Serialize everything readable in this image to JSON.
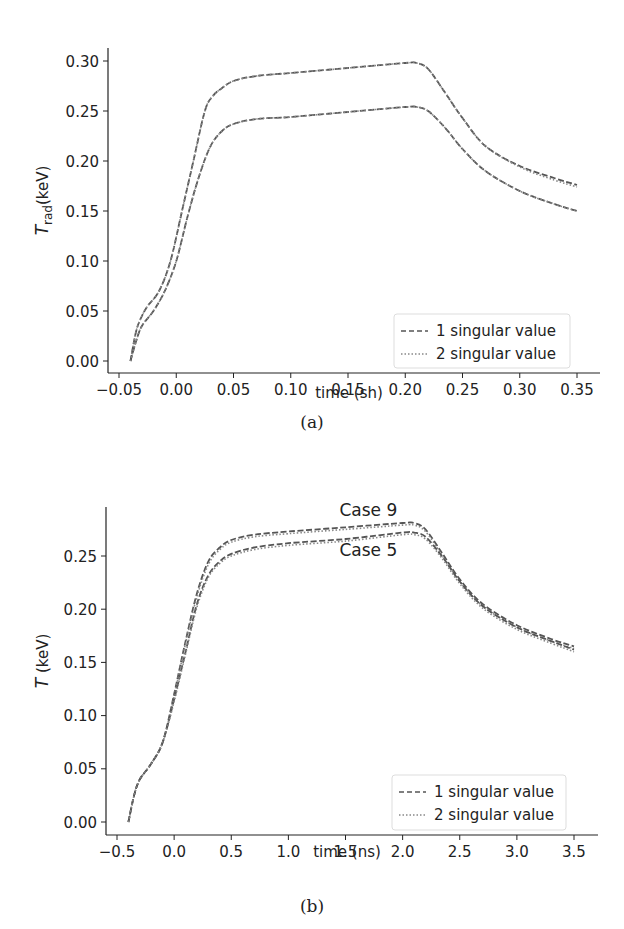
{
  "chart_data": [
    {
      "id": "a",
      "type": "line",
      "caption": "(a)",
      "title": "",
      "xlabel": "time (sh)",
      "ylabel_main": "T",
      "ylabel_sub": "rad",
      "ylabel_unit": "(keV)",
      "xlim": [
        -0.05,
        0.35
      ],
      "ylim": [
        0.0,
        0.3
      ],
      "xticks": [
        "−0.05",
        "0.00",
        "0.05",
        "0.10",
        "0.15",
        "0.20",
        "0.25",
        "0.30",
        "0.35"
      ],
      "xtick_values": [
        -0.05,
        0.0,
        0.05,
        0.1,
        0.15,
        0.2,
        0.25,
        0.3,
        0.35
      ],
      "yticks": [
        "0.00",
        "0.05",
        "0.10",
        "0.15",
        "0.20",
        "0.25",
        "0.30"
      ],
      "ytick_values": [
        0.0,
        0.05,
        0.1,
        0.15,
        0.2,
        0.25,
        0.3
      ],
      "grid": false,
      "legend_position": "lower right",
      "legend": [
        {
          "label": "1 singular value",
          "style": "dashed"
        },
        {
          "label": "2 singular value",
          "style": "dotted"
        }
      ],
      "series": [
        {
          "name": "upper case - 1 singular value",
          "style": "dashed",
          "x": [
            -0.04,
            -0.035,
            -0.03,
            -0.025,
            -0.015,
            -0.005,
            0.005,
            0.015,
            0.025,
            0.032,
            0.04,
            0.05,
            0.07,
            0.1,
            0.15,
            0.2,
            0.21,
            0.22,
            0.235,
            0.25,
            0.27,
            0.3,
            0.33,
            0.35
          ],
          "y": [
            0.0,
            0.03,
            0.045,
            0.055,
            0.07,
            0.1,
            0.15,
            0.2,
            0.25,
            0.265,
            0.273,
            0.28,
            0.285,
            0.288,
            0.293,
            0.298,
            0.298,
            0.292,
            0.268,
            0.243,
            0.215,
            0.195,
            0.183,
            0.176
          ]
        },
        {
          "name": "upper case - 2 singular value",
          "style": "dotted",
          "x": [
            -0.04,
            -0.035,
            -0.03,
            -0.025,
            -0.015,
            -0.005,
            0.005,
            0.015,
            0.025,
            0.032,
            0.04,
            0.05,
            0.07,
            0.1,
            0.15,
            0.2,
            0.21,
            0.22,
            0.235,
            0.25,
            0.27,
            0.3,
            0.33,
            0.35
          ],
          "y": [
            0.0,
            0.03,
            0.045,
            0.055,
            0.07,
            0.1,
            0.15,
            0.2,
            0.25,
            0.265,
            0.273,
            0.28,
            0.285,
            0.288,
            0.293,
            0.298,
            0.298,
            0.292,
            0.268,
            0.243,
            0.215,
            0.194,
            0.181,
            0.174
          ]
        },
        {
          "name": "lower case - 1 singular value",
          "style": "dashed",
          "x": [
            -0.04,
            -0.035,
            -0.03,
            -0.02,
            -0.01,
            0.0,
            0.01,
            0.02,
            0.03,
            0.04,
            0.05,
            0.07,
            0.1,
            0.15,
            0.2,
            0.21,
            0.22,
            0.235,
            0.25,
            0.27,
            0.3,
            0.33,
            0.35
          ],
          "y": [
            0.0,
            0.02,
            0.035,
            0.05,
            0.07,
            0.1,
            0.145,
            0.185,
            0.215,
            0.23,
            0.237,
            0.242,
            0.244,
            0.249,
            0.254,
            0.254,
            0.25,
            0.233,
            0.212,
            0.19,
            0.17,
            0.157,
            0.15
          ]
        },
        {
          "name": "lower case - 2 singular value",
          "style": "dotted",
          "x": [
            -0.04,
            -0.035,
            -0.03,
            -0.02,
            -0.01,
            0.0,
            0.01,
            0.02,
            0.03,
            0.04,
            0.05,
            0.07,
            0.1,
            0.15,
            0.2,
            0.21,
            0.22,
            0.235,
            0.25,
            0.27,
            0.3,
            0.33,
            0.35
          ],
          "y": [
            0.0,
            0.02,
            0.035,
            0.05,
            0.07,
            0.1,
            0.145,
            0.185,
            0.215,
            0.23,
            0.237,
            0.242,
            0.244,
            0.249,
            0.254,
            0.254,
            0.25,
            0.233,
            0.212,
            0.19,
            0.17,
            0.157,
            0.15
          ]
        }
      ],
      "annotations": []
    },
    {
      "id": "b",
      "type": "line",
      "caption": "(b)",
      "title": "",
      "xlabel": "time (ns)",
      "ylabel_main": "T",
      "ylabel_sub": "",
      "ylabel_unit": " (keV)",
      "xlim": [
        -0.5,
        3.5
      ],
      "ylim": [
        0.0,
        0.25
      ],
      "xticks": [
        "−0.5",
        "0.0",
        "0.5",
        "1.0",
        "1.5",
        "2.0",
        "2.5",
        "3.0",
        "3.5"
      ],
      "xtick_values": [
        -0.5,
        0.0,
        0.5,
        1.0,
        1.5,
        2.0,
        2.5,
        3.0,
        3.5
      ],
      "yticks": [
        "0.00",
        "0.05",
        "0.10",
        "0.15",
        "0.20",
        "0.25"
      ],
      "ytick_values": [
        0.0,
        0.05,
        0.1,
        0.15,
        0.2,
        0.25
      ],
      "grid": false,
      "legend_position": "lower right",
      "legend": [
        {
          "label": "1 singular value",
          "style": "dashed"
        },
        {
          "label": "2 singular value",
          "style": "dotted"
        }
      ],
      "series": [
        {
          "name": "Case 9 - 1 singular value",
          "style": "dashed",
          "x": [
            -0.4,
            -0.35,
            -0.3,
            -0.2,
            -0.1,
            0.0,
            0.1,
            0.2,
            0.3,
            0.4,
            0.5,
            0.7,
            1.0,
            1.5,
            2.0,
            2.1,
            2.2,
            2.35,
            2.5,
            2.7,
            3.0,
            3.3,
            3.5
          ],
          "y": [
            0.0,
            0.025,
            0.04,
            0.055,
            0.075,
            0.12,
            0.17,
            0.215,
            0.245,
            0.258,
            0.265,
            0.27,
            0.273,
            0.277,
            0.281,
            0.281,
            0.275,
            0.252,
            0.228,
            0.205,
            0.185,
            0.172,
            0.165
          ]
        },
        {
          "name": "Case 9 - 2 singular value",
          "style": "dotted",
          "x": [
            -0.4,
            -0.35,
            -0.3,
            -0.2,
            -0.1,
            0.0,
            0.1,
            0.2,
            0.3,
            0.4,
            0.5,
            0.7,
            1.0,
            1.5,
            2.0,
            2.1,
            2.2,
            2.35,
            2.5,
            2.7,
            3.0,
            3.3,
            3.5
          ],
          "y": [
            0.0,
            0.025,
            0.04,
            0.055,
            0.075,
            0.118,
            0.168,
            0.212,
            0.242,
            0.256,
            0.263,
            0.268,
            0.271,
            0.275,
            0.279,
            0.279,
            0.273,
            0.25,
            0.226,
            0.203,
            0.183,
            0.17,
            0.163
          ]
        },
        {
          "name": "Case 5 - 1 singular value",
          "style": "dashed",
          "x": [
            -0.4,
            -0.35,
            -0.3,
            -0.2,
            -0.1,
            0.0,
            0.1,
            0.2,
            0.3,
            0.4,
            0.5,
            0.7,
            1.0,
            1.5,
            2.0,
            2.1,
            2.2,
            2.35,
            2.5,
            2.7,
            3.0,
            3.3,
            3.5
          ],
          "y": [
            0.0,
            0.025,
            0.04,
            0.055,
            0.075,
            0.115,
            0.16,
            0.205,
            0.232,
            0.245,
            0.252,
            0.258,
            0.262,
            0.266,
            0.272,
            0.272,
            0.268,
            0.249,
            0.226,
            0.203,
            0.183,
            0.17,
            0.162
          ]
        },
        {
          "name": "Case 5 - 2 singular value",
          "style": "dotted",
          "x": [
            -0.4,
            -0.35,
            -0.3,
            -0.2,
            -0.1,
            0.0,
            0.1,
            0.2,
            0.3,
            0.4,
            0.5,
            0.7,
            1.0,
            1.5,
            2.0,
            2.1,
            2.2,
            2.35,
            2.5,
            2.7,
            3.0,
            3.3,
            3.5
          ],
          "y": [
            0.0,
            0.025,
            0.04,
            0.055,
            0.075,
            0.113,
            0.158,
            0.202,
            0.23,
            0.243,
            0.25,
            0.256,
            0.26,
            0.264,
            0.27,
            0.27,
            0.266,
            0.247,
            0.224,
            0.201,
            0.181,
            0.168,
            0.16
          ]
        }
      ],
      "annotations": [
        {
          "text": "Case 9",
          "x": 1.7,
          "y": 0.288
        },
        {
          "text": "Case 5",
          "x": 1.7,
          "y": 0.25
        }
      ]
    }
  ],
  "colors": {
    "line": "#555555",
    "dotted_line": "#888888",
    "axis": "#222222",
    "legend_border": "#dddddd"
  },
  "layout": {
    "panels": [
      {
        "left": 108,
        "top": 48,
        "right": 600,
        "bottom": 373,
        "x0px": 119,
        "x1px": 577,
        "y0px": 361,
        "y1px": 61,
        "legend": {
          "x": 394,
          "y": 314,
          "w": 176,
          "h": 54
        },
        "xlabel_y": 398,
        "caption_y": 428,
        "ylabel_x": 48
      },
      {
        "left": 106,
        "top": 507,
        "right": 598,
        "bottom": 835,
        "x0px": 117,
        "x1px": 574,
        "y0px": 822,
        "y1px": 556,
        "legend": {
          "x": 392,
          "y": 775,
          "w": 174,
          "h": 55
        },
        "xlabel_y": 857,
        "caption_y": 912,
        "ylabel_x": 48
      }
    ]
  }
}
